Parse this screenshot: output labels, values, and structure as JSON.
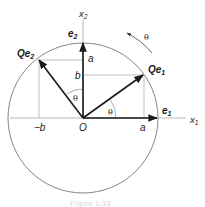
{
  "diagram": {
    "axes": {
      "x1_label": "x",
      "x1_sub": "1",
      "x2_label": "x",
      "x2_sub": "2",
      "origin_label": "O"
    },
    "vectors": {
      "e1": {
        "label": "e",
        "sub": "1"
      },
      "e2": {
        "label": "e",
        "sub": "2"
      },
      "Qe1": {
        "label": "Qe",
        "sub": "1"
      },
      "Qe2": {
        "label": "Qe",
        "sub": "2"
      }
    },
    "components": {
      "a_on_x1": "a",
      "neg_b_on_x1": "−b",
      "a_on_x2": "a",
      "b_on_x2": "b"
    },
    "angles": {
      "theta_between_e1_Qe1": "θ",
      "theta_between_e2_Qe2": "θ",
      "rotation_direction": "θ"
    },
    "colors": {
      "vector": "#1a1a1a",
      "circle": "#777777",
      "guide": "#b0b0b0"
    },
    "caption": "Figure 1.33"
  }
}
